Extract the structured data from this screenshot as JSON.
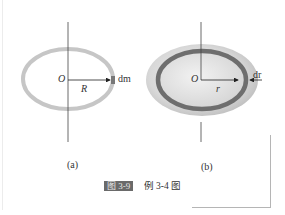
{
  "figure": {
    "caption_number": "图 3-9",
    "caption_text": "例 3-4 图",
    "panels": [
      {
        "id": "a",
        "label": "(a)",
        "description": "Thin ring rotating about vertical axis through center",
        "origin_label": "O",
        "radius_label": "R",
        "element_label": "dm"
      },
      {
        "id": "b",
        "label": "(b)",
        "description": "Solid disk with thin annular ring element",
        "origin_label": "O",
        "radius_label": "r",
        "element_label": "dr"
      }
    ]
  },
  "colors": {
    "ring_light": "#c8c8c8",
    "ring_dark": "#6e6e6e",
    "disk_fill": "#d9d9d9",
    "axis": "#444444",
    "text": "#222222"
  }
}
